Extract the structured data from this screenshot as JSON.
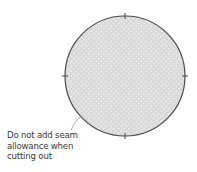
{
  "diagram": {
    "shape": "circle",
    "fill_color": "#d9d9d9",
    "dot_color": "#f4f4f4",
    "outline_color": "#4a4a4a",
    "tick_marks": [
      "top",
      "right",
      "bottom",
      "left"
    ],
    "leader_line_color": "#9a9a9a"
  },
  "annotation": {
    "lines": [
      "Do not add seam",
      "allowance when",
      "cutting out"
    ]
  }
}
